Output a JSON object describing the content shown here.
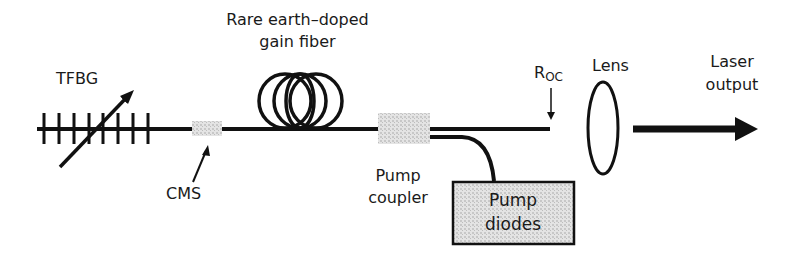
{
  "diagram": {
    "colors": {
      "line": "#111111",
      "component_fill": "#d9d9d9",
      "text": "#1a1a1a",
      "background": "#ffffff"
    },
    "labels": {
      "tfbg": "TFBG",
      "gain_fiber_line1": "Rare earth–doped",
      "gain_fiber_line2": "gain fiber",
      "cms": "CMS",
      "pump_coupler_line1": "Pump",
      "pump_coupler_line2": "coupler",
      "pump_diodes_line1": "Pump",
      "pump_diodes_line2": "diodes",
      "roc_main": "R",
      "roc_sub": "OC",
      "lens": "Lens",
      "laser_output_line1": "Laser",
      "laser_output_line2": "output"
    },
    "components": [
      {
        "id": "tfbg",
        "name": "Tilted fiber Bragg grating",
        "ticks": 8
      },
      {
        "id": "cms",
        "name": "CMS"
      },
      {
        "id": "gain-fiber",
        "name": "Rare earth–doped gain fiber",
        "coils": 3
      },
      {
        "id": "pump-coupler",
        "name": "Pump coupler"
      },
      {
        "id": "pump-diodes",
        "name": "Pump diodes"
      },
      {
        "id": "roc",
        "name": "ROC"
      },
      {
        "id": "lens",
        "name": "Lens"
      },
      {
        "id": "laser-output",
        "name": "Laser output"
      }
    ]
  }
}
